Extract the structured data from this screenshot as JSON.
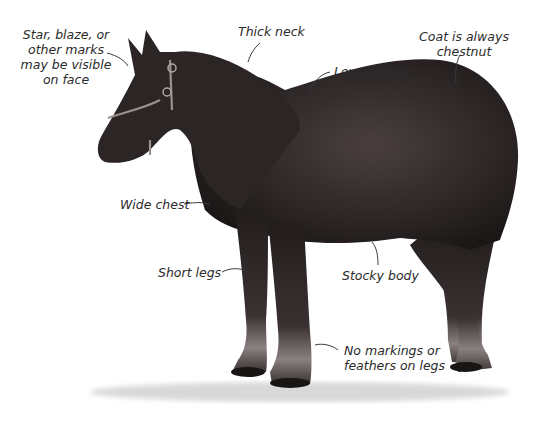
{
  "diagram": {
    "coat_color": "#2e2727",
    "background": "#ffffff",
    "labels": [
      {
        "id": "face",
        "lines": [
          "Star, blaze, or",
          "other marks",
          "may be visible",
          "on face"
        ]
      },
      {
        "id": "neck",
        "lines": [
          "Thick neck"
        ]
      },
      {
        "id": "withers",
        "lines": [
          "Low withers"
        ]
      },
      {
        "id": "coat",
        "lines": [
          "Coat is always",
          "chestnut"
        ]
      },
      {
        "id": "chest",
        "lines": [
          "Wide chest"
        ]
      },
      {
        "id": "legs",
        "lines": [
          "Short legs"
        ]
      },
      {
        "id": "body",
        "lines": [
          "Stocky body"
        ]
      },
      {
        "id": "markings",
        "lines": [
          "No markings or",
          "feathers on legs"
        ]
      }
    ]
  }
}
